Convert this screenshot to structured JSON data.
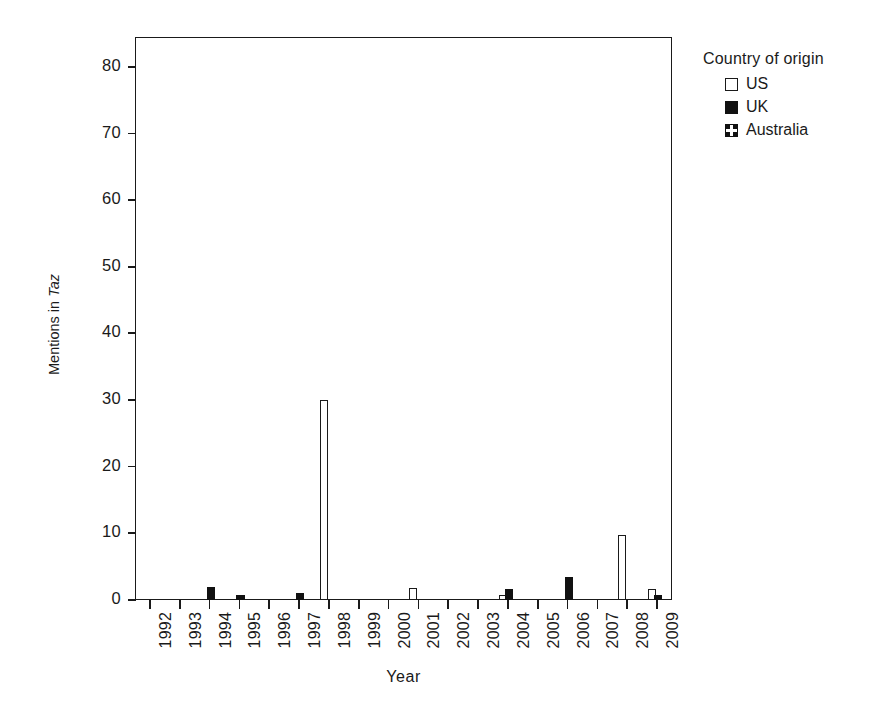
{
  "chart_data": {
    "type": "bar",
    "title": "",
    "xlabel": "Year",
    "ylabel": "Mentions in Taz",
    "ylabel_plain": "Mentions in ",
    "ylabel_italic": "Taz",
    "categories": [
      "1992",
      "1993",
      "1994",
      "1995",
      "1996",
      "1997",
      "1998",
      "1999",
      "2000",
      "2001",
      "2002",
      "2003",
      "2004",
      "2005",
      "2006",
      "2007",
      "2008",
      "2009"
    ],
    "series": [
      {
        "name": "US",
        "style": "open-white",
        "color": "#ffffff",
        "edge": "#1a1a1a",
        "values": [
          0,
          0,
          0,
          0,
          0,
          0,
          30,
          0,
          0,
          1.8,
          0,
          0,
          0.8,
          0,
          0,
          0,
          9.8,
          1.6
        ]
      },
      {
        "name": "UK",
        "style": "solid-black",
        "color": "#111111",
        "edge": "#111111",
        "values": [
          0,
          0,
          2,
          0.8,
          0,
          1,
          0,
          0,
          0,
          0,
          0,
          0,
          1.6,
          0,
          3.5,
          0,
          0,
          0.8
        ]
      },
      {
        "name": "Australia",
        "style": "cross-hatch",
        "color": "#111111",
        "edge": "#111111",
        "values": [
          0,
          0,
          0,
          0,
          0,
          0,
          0,
          0,
          0,
          0,
          0,
          0,
          0,
          0,
          0,
          0,
          0,
          0
        ]
      }
    ],
    "yticks": [
      0,
      10,
      20,
      30,
      40,
      50,
      60,
      70,
      80
    ],
    "ylim": [
      0,
      84.5
    ],
    "xlim_note": "categorical, 18 years",
    "grid": false,
    "legend_position": "right-top"
  },
  "legend": {
    "title": "Country of origin",
    "entries": [
      {
        "label": "US",
        "swatch": "open-square-white"
      },
      {
        "label": "UK",
        "swatch": "filled-square-black"
      },
      {
        "label": "Australia",
        "swatch": "cross-pattern-square"
      }
    ]
  }
}
